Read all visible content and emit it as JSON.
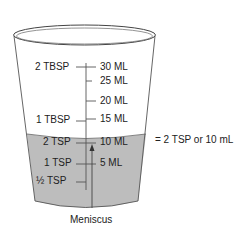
{
  "diagram": {
    "left_labels": [
      {
        "text": "2 TBSP",
        "y": 67
      },
      {
        "text": "1 TBSP",
        "y": 120
      },
      {
        "text": "2 TSP",
        "y": 142
      },
      {
        "text": "1 TSP",
        "y": 163
      },
      {
        "text": "½ TSP",
        "y": 181
      }
    ],
    "right_labels": [
      {
        "text": "30 ML",
        "y": 67
      },
      {
        "text": "25 ML",
        "y": 81
      },
      {
        "text": "20 ML",
        "y": 101
      },
      {
        "text": "15 ML",
        "y": 119
      },
      {
        "text": "10 ML",
        "y": 142
      },
      {
        "text": "5 ML",
        "y": 163
      }
    ],
    "equivalence_label": "= 2 TSP or 10 mL",
    "meniscus_label": "Meniscus",
    "colors": {
      "liquid": "#bdbdbd",
      "outline": "#555555",
      "text": "#222222"
    }
  }
}
